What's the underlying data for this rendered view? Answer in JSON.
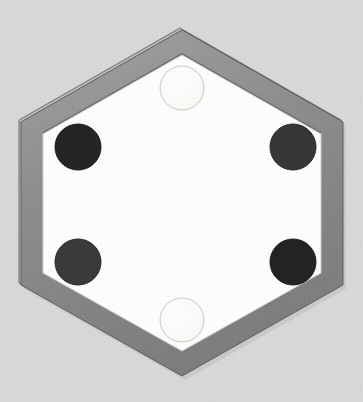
{
  "scene": {
    "title": "Hexagonal tile with six circular tokens",
    "canvas": {
      "width": 363,
      "height": 402
    },
    "background_color": "#d9d9d9"
  },
  "hexagon": {
    "name": "hexagon-tile",
    "orientation": "pointy-top",
    "center": {
      "x": 182,
      "y": 203
    },
    "outer_vertices": [
      {
        "x": 182,
        "y": 30
      },
      {
        "x": 343,
        "y": 122
      },
      {
        "x": 343,
        "y": 285
      },
      {
        "x": 182,
        "y": 376
      },
      {
        "x": 21,
        "y": 285
      },
      {
        "x": 21,
        "y": 122
      }
    ],
    "inner_vertices": [
      {
        "x": 182,
        "y": 55
      },
      {
        "x": 321,
        "y": 134
      },
      {
        "x": 321,
        "y": 273
      },
      {
        "x": 182,
        "y": 351
      },
      {
        "x": 43,
        "y": 273
      },
      {
        "x": 43,
        "y": 134
      }
    ],
    "rim_thickness_px": 14,
    "rim_color": "#8f8f8f",
    "rim_bevel_light_color": "#b4b4b4",
    "rim_bevel_dark_color": "#6e6e6e",
    "rim_outline_color": "#5f5f5f",
    "interior_color": "#fefefe",
    "interior_edge_color": "#d0d0d0"
  },
  "tokens": [
    {
      "id": "token-top",
      "label": "light token top",
      "color_class": "light",
      "cx": 182,
      "cy": 88,
      "r": 22,
      "fill": "#fafaf7",
      "stroke": "#c6c6c6",
      "stroke_width": 1
    },
    {
      "id": "token-upper-left",
      "label": "dark token upper left",
      "color_class": "dark",
      "cx": 78,
      "cy": 147,
      "r": 23,
      "fill": "#242424",
      "stroke": "#1a1a1a",
      "stroke_width": 1
    },
    {
      "id": "token-upper-right",
      "label": "dark token upper right",
      "color_class": "dark",
      "cx": 293,
      "cy": 147,
      "r": 23,
      "fill": "#363636",
      "stroke": "#262626",
      "stroke_width": 1
    },
    {
      "id": "token-lower-left",
      "label": "dark token lower left",
      "color_class": "dark",
      "cx": 78,
      "cy": 262,
      "r": 23,
      "fill": "#3a3a3a",
      "stroke": "#282828",
      "stroke_width": 1
    },
    {
      "id": "token-lower-right",
      "label": "dark token lower right",
      "color_class": "dark",
      "cx": 293,
      "cy": 262,
      "r": 23,
      "fill": "#232323",
      "stroke": "#191919",
      "stroke_width": 1
    },
    {
      "id": "token-bottom",
      "label": "light token bottom",
      "color_class": "light",
      "cx": 182,
      "cy": 320,
      "r": 22,
      "fill": "#fbfbf8",
      "stroke": "#c6c6c6",
      "stroke_width": 1
    }
  ],
  "counts": {
    "dark_tokens": 4,
    "light_tokens": 2,
    "total_tokens": 6
  }
}
